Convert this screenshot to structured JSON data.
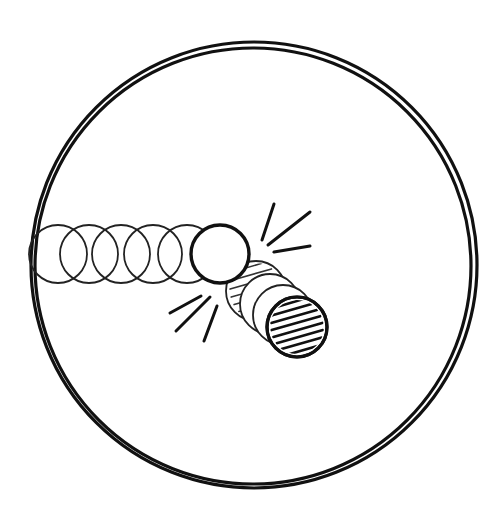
{
  "diagram": {
    "title": "",
    "colors": {
      "ink": "#111111",
      "background": "#ffffff"
    },
    "boundary": {
      "shape": "double-ring",
      "cx": 254,
      "cy": 265,
      "r_outer": 223,
      "r_inner": 218
    },
    "striker_ball": {
      "label": "",
      "cx": 220,
      "cy": 254,
      "r": 29,
      "trail": [
        {
          "cx": 58,
          "cy": 254
        },
        {
          "cx": 89,
          "cy": 254
        },
        {
          "cx": 121,
          "cy": 254
        },
        {
          "cx": 153,
          "cy": 254
        },
        {
          "cx": 187,
          "cy": 254
        }
      ]
    },
    "target_ball": {
      "label": "",
      "cx": 297,
      "cy": 327,
      "r": 30,
      "pattern": "diagonal-hatch",
      "trail": [
        {
          "cx": 256,
          "cy": 291
        },
        {
          "cx": 270,
          "cy": 304
        },
        {
          "cx": 283,
          "cy": 315
        }
      ]
    },
    "impact_marks": {
      "upper_right": [
        {
          "x1": 274,
          "y1": 204,
          "x2": 262,
          "y2": 240
        },
        {
          "x1": 310,
          "y1": 212,
          "x2": 268,
          "y2": 245
        },
        {
          "x1": 310,
          "y1": 246,
          "x2": 274,
          "y2": 252
        }
      ],
      "lower_left": [
        {
          "x1": 170,
          "y1": 313,
          "x2": 201,
          "y2": 296
        },
        {
          "x1": 176,
          "y1": 331,
          "x2": 210,
          "y2": 297
        },
        {
          "x1": 204,
          "y1": 341,
          "x2": 217,
          "y2": 306
        }
      ]
    }
  }
}
